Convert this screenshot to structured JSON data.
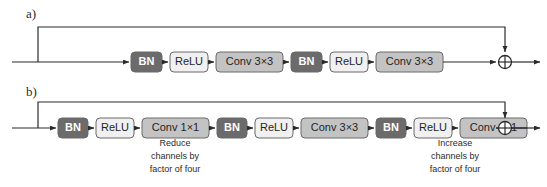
{
  "figure": {
    "type": "diagram",
    "background_color": "#ffffff",
    "line_color": "#2b2b2b",
    "panels": [
      {
        "id": "a",
        "label": "a)",
        "label_x": 26,
        "label_y": 18,
        "baseline_y": 62,
        "skip_y": 27,
        "skip_branch_x": 38,
        "skip_join_x": 505,
        "input_x": 12,
        "output_x": 540,
        "sum_x": 505,
        "sum_label": "plus-sum-node",
        "blocks": [
          {
            "name": "bn-1",
            "label": "BN",
            "x": 131,
            "width": 31,
            "style": "dark"
          },
          {
            "name": "relu-1",
            "label": "ReLU",
            "x": 170,
            "width": 38,
            "style": "light"
          },
          {
            "name": "conv-1",
            "label": "Conv 3×3",
            "x": 216,
            "width": 67,
            "style": "mid"
          },
          {
            "name": "bn-2",
            "label": "BN",
            "x": 291,
            "width": 31,
            "style": "dark"
          },
          {
            "name": "relu-2",
            "label": "ReLU",
            "x": 330,
            "width": 38,
            "style": "light"
          },
          {
            "name": "conv-2",
            "label": "Conv 3×3",
            "x": 376,
            "width": 67,
            "style": "mid"
          }
        ],
        "captions": []
      },
      {
        "id": "b",
        "label": "b)",
        "label_x": 26,
        "label_y": 96,
        "baseline_y": 128,
        "skip_y": 102,
        "skip_branch_x": 38,
        "skip_join_x": 505,
        "input_x": 12,
        "output_x": 540,
        "sum_x": 505,
        "sum_label": "plus-sum-node",
        "blocks": [
          {
            "name": "bn-1",
            "label": "BN",
            "x": 58,
            "width": 30,
            "style": "dark"
          },
          {
            "name": "relu-1",
            "label": "ReLU",
            "x": 96,
            "width": 38,
            "style": "light"
          },
          {
            "name": "conv-1",
            "label": "Conv 1×1",
            "x": 142,
            "width": 67,
            "style": "mid"
          },
          {
            "name": "bn-2",
            "label": "BN",
            "x": 217,
            "width": 30,
            "style": "dark"
          },
          {
            "name": "relu-2",
            "label": "ReLU",
            "x": 255,
            "width": 38,
            "style": "light"
          },
          {
            "name": "conv-2",
            "label": "Conv 3×3",
            "x": 301,
            "width": 67,
            "style": "mid"
          },
          {
            "name": "bn-3",
            "label": "BN",
            "x": 376,
            "width": 30,
            "style": "dark"
          },
          {
            "name": "relu-3",
            "label": "ReLU",
            "x": 414,
            "width": 38,
            "style": "light"
          },
          {
            "name": "conv-3",
            "label": "Conv 1×1",
            "x": 460,
            "width": 67,
            "style": "mid"
          }
        ],
        "captions": [
          {
            "name": "reduce-channels-caption",
            "center_x": 175,
            "top_y": 146,
            "lines": [
              "Reduce",
              "channels by",
              "factor of four"
            ]
          },
          {
            "name": "increase-channels-caption",
            "center_x": 455,
            "top_y": 146,
            "lines": [
              "Increase",
              "channels by",
              "factor of four"
            ]
          }
        ]
      }
    ],
    "block_styles": {
      "dark": {
        "fill": "#6b6b6b",
        "stroke": "#4a4a4a",
        "text": "#ffffff"
      },
      "mid": {
        "fill": "#c3c3c3",
        "stroke": "#8a8a8a",
        "text": "#1f1f1f"
      },
      "light": {
        "fill": "#f0f0f0",
        "stroke": "#8a8a8a",
        "text": "#1f1f1f"
      }
    },
    "block_height": 20,
    "block_radius": 4
  }
}
